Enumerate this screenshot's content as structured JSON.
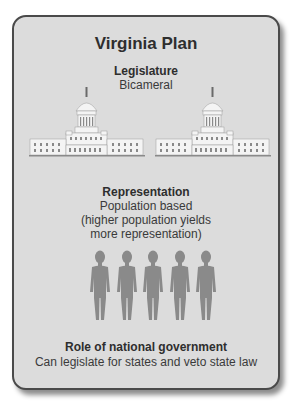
{
  "title": "Virginia Plan",
  "sections": [
    {
      "heading": "Legislature",
      "body_lines": [
        "Bicameral"
      ],
      "icon": "capitol-building-icon",
      "icon_count": 2
    },
    {
      "heading": "Representation",
      "body_lines": [
        "Population based",
        "(higher population yields",
        "more representation)"
      ],
      "icon": "person-silhouette-icon",
      "icon_count": 5
    },
    {
      "heading": "Role of national government",
      "body_lines": [
        "Can legislate for states and veto state law"
      ]
    }
  ],
  "colors": {
    "card_background": "#dcdcdc",
    "card_border": "#4a4a4a",
    "text": "#2e2e2e",
    "building": "#f4f4f4",
    "person": "#8a8a8a"
  }
}
